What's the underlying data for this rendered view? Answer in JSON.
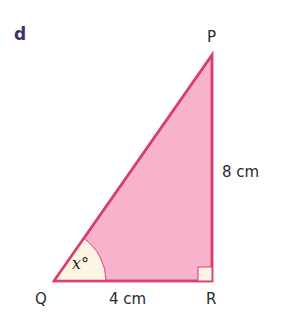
{
  "part_label": "d",
  "vertices": {
    "P": "P",
    "Q": "Q",
    "R": "R"
  },
  "sides": {
    "PR": "8 cm",
    "QR": "4 cm"
  },
  "angle": {
    "symbol": "x",
    "unit": "°"
  },
  "colors": {
    "fill": "#f4a9c3",
    "stroke": "#d8406e",
    "angle_fill": "#fdf6e3",
    "part_label": "#3b3468"
  }
}
